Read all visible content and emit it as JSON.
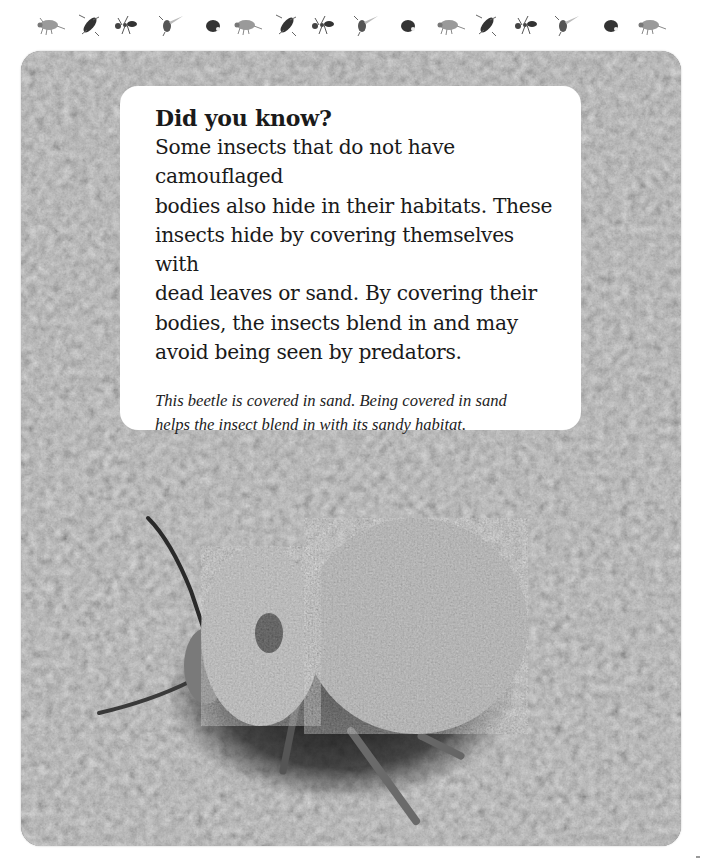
{
  "page": {
    "decorative_border": {
      "icons": [
        "beetle-icon",
        "wasp-icon",
        "ant-icon",
        "fly-icon",
        "ladybug-icon",
        "beetle-icon",
        "wasp-icon",
        "ant-icon",
        "fly-icon",
        "ladybug-icon",
        "beetle-icon",
        "wasp-icon",
        "ant-icon",
        "fly-icon",
        "ladybug-icon",
        "beetle-icon"
      ]
    },
    "photo": {
      "subject": "sand-covered beetle on sand",
      "tone": "grayscale"
    },
    "info_card": {
      "heading": "Did you know?",
      "body_lines": [
        "Some insects that do not have camouflaged",
        "bodies also hide in their habitats. These",
        "insects hide by covering themselves with",
        "dead leaves or sand. By covering their",
        "bodies, the insects blend in and may",
        "avoid being seen by predators."
      ],
      "caption_lines": [
        "This beetle is covered in sand. Being covered in sand",
        "helps the insect blend in with its sandy habitat."
      ]
    },
    "colors": {
      "page_background": "#ffffff",
      "card_background": "#ffffff",
      "text": "#1a1a1a",
      "sand_mid": "#8a8a8a",
      "sand_dark": "#4a4a4a",
      "sand_light": "#bdbdbd"
    }
  }
}
